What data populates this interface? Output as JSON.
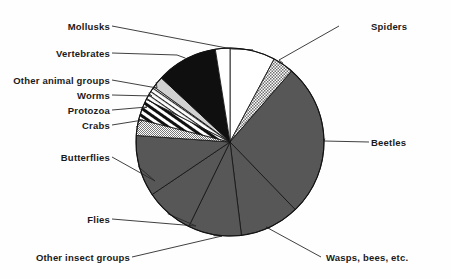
{
  "figure": {
    "background_color": "#fefefe",
    "outline_color": "#111111",
    "leader_color": "#2a2a2a"
  },
  "chart_data": {
    "type": "pie",
    "title": "",
    "subtitle": "",
    "xlabel": "",
    "ylabel": "",
    "legend_position": "none",
    "grid": false,
    "labels_placement": "external-with-leader-lines",
    "start_angle_deg": 0,
    "direction": "clockwise",
    "units": "degrees of arc",
    "categories": [
      "Mollusks",
      "Spiders",
      "Beetles",
      "Wasps, bees, etc.",
      "Other insect groups",
      "Flies",
      "Butterflies",
      "Crabs",
      "Protozoa",
      "Worms",
      "Other animal groups",
      "Vertebrates"
    ],
    "values": [
      28,
      13,
      95,
      37,
      33,
      30,
      38,
      10,
      13,
      9,
      7,
      38
    ],
    "slices": [
      {
        "label": "Mollusks",
        "angle_deg": 28,
        "start_deg": 0,
        "end_deg": 28,
        "fill": "white",
        "fill_color": "#ffffff"
      },
      {
        "label": "Spiders",
        "angle_deg": 13,
        "start_deg": 28,
        "end_deg": 41,
        "fill": "grey-checker",
        "fill_color": "#8f8f8f"
      },
      {
        "label": "Beetles",
        "angle_deg": 95,
        "start_deg": 41,
        "end_deg": 136,
        "fill": "dark-grey-solid",
        "fill_color": "#555555"
      },
      {
        "label": "Wasps, bees, etc.",
        "angle_deg": 37,
        "start_deg": 136,
        "end_deg": 173,
        "fill": "dark-grey-solid",
        "fill_color": "#555555"
      },
      {
        "label": "Other insect groups",
        "angle_deg": 33,
        "start_deg": 173,
        "end_deg": 206,
        "fill": "dark-grey-solid",
        "fill_color": "#555555"
      },
      {
        "label": "Flies",
        "angle_deg": 30,
        "start_deg": 206,
        "end_deg": 236,
        "fill": "dark-grey-solid",
        "fill_color": "#555555"
      },
      {
        "label": "Butterflies",
        "angle_deg": 38,
        "start_deg": 236,
        "end_deg": 274,
        "fill": "dark-grey-solid",
        "fill_color": "#555555"
      },
      {
        "label": "Crabs",
        "angle_deg": 10,
        "start_deg": 274,
        "end_deg": 284,
        "fill": "fine-grey-checker",
        "fill_color": "#9a9a9a"
      },
      {
        "label": "Protozoa",
        "angle_deg": 13,
        "start_deg": 284,
        "end_deg": 297,
        "fill": "bold-diagonal-stripes",
        "fill_color": "#111111"
      },
      {
        "label": "Worms",
        "angle_deg": 9,
        "start_deg": 297,
        "end_deg": 306,
        "fill": "thin-diagonal-hatch",
        "fill_color": "#333333"
      },
      {
        "label": "Other animal groups",
        "angle_deg": 7,
        "start_deg": 306,
        "end_deg": 313,
        "fill": "light-grey",
        "fill_color": "#cfcfcf"
      },
      {
        "label": "Vertebrates",
        "angle_deg": 38,
        "start_deg": 313,
        "end_deg": 351,
        "fill": "black-solid",
        "fill_color": "#0f0f0f"
      },
      {
        "label": "Mollusks-wrap",
        "angle_deg": 9,
        "start_deg": 351,
        "end_deg": 360,
        "fill": "white",
        "fill_color": "#ffffff"
      }
    ]
  },
  "labels": {
    "mollusks": "Mollusks",
    "spiders": "Spiders",
    "vertebrates": "Vertebrates",
    "other_animal_groups": "Other animal groups",
    "worms": "Worms",
    "protozoa": "Protozoa",
    "crabs": "Crabs",
    "butterflies": "Butterflies",
    "flies": "Flies",
    "other_insect_groups": "Other insect groups",
    "beetles": "Beetles",
    "wasps_bees_etc": "Wasps, bees, etc."
  }
}
